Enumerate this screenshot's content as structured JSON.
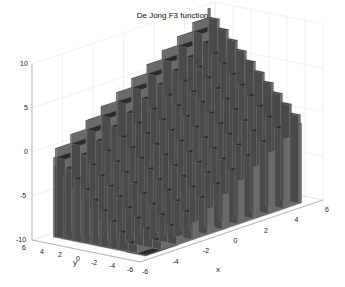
{
  "chart_data": {
    "type": "surface3d",
    "title": "De Jong F3 function",
    "function": "f(x,y) = floor(x) + floor(y)",
    "xlabel": "x",
    "ylabel": "y",
    "zlabel": "",
    "xlim": [
      -6,
      6
    ],
    "ylim": [
      -6,
      6
    ],
    "zlim": [
      -10,
      10
    ],
    "x_ticks": [
      "-6",
      "-4",
      "-2",
      "0",
      "2",
      "4",
      "6"
    ],
    "y_ticks": [
      "6",
      "4",
      "2",
      "0",
      "-2",
      "-4",
      "-6"
    ],
    "z_ticks": [
      "10",
      "5",
      "0",
      "-5",
      "-10"
    ],
    "grid": true,
    "colormap": "gray (dark surface with light mesh edges)",
    "surface_domain": [
      -5.12,
      5.12
    ],
    "surface_range": [
      -12,
      10
    ]
  },
  "colors": {
    "surface_top": "#2a2a2a",
    "surface_side": "#6a6a6a",
    "mesh": "#8a8a8a",
    "grid": "#e6e6e6",
    "axis": "#9a9a9a",
    "text": "#222222"
  }
}
